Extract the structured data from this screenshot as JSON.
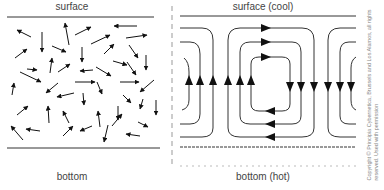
{
  "left_panel": {
    "top_label": "surface",
    "bottom_label": "bottom",
    "description": "random particle motion arrows"
  },
  "right_panel": {
    "top_label": "surface (cool)",
    "bottom_label": "bottom (hot)",
    "description": "convection cells with circulating arrows"
  },
  "copyright": {
    "line1": "Copyright © Principia Cybernetica, Brussels and Los Alamos, all rights",
    "line2": "reserved. Used with permission"
  },
  "colors": {
    "line": "#222222",
    "arrow": "#111111",
    "divider": "#999999",
    "text": "#444444"
  }
}
